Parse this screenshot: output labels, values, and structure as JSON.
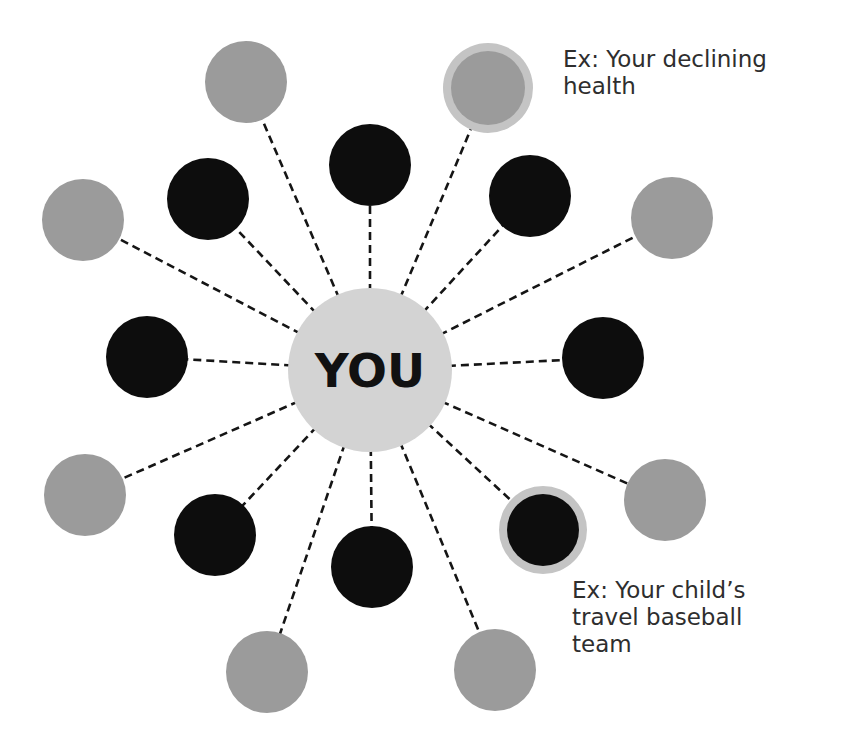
{
  "diagram": {
    "center": {
      "label": "YOU",
      "x": 370,
      "y": 370,
      "r": 82,
      "color": "#d3d3d3"
    },
    "colors": {
      "black_node": "#0d0d0d",
      "gray_node": "#9b9b9b",
      "highlight_ring": "#c4c4c4",
      "highlight_gray_inner": "#9b9b9b",
      "connector": "#151515",
      "text": "#2e2e2e"
    },
    "nodes": [
      {
        "id": "gray-top-left",
        "type": "gray",
        "x": 246,
        "y": 82,
        "r": 41
      },
      {
        "id": "gray-top-right-highlighted",
        "type": "gray",
        "highlight": true,
        "x": 488,
        "y": 88,
        "r": 37,
        "ring_r": 45
      },
      {
        "id": "black-top",
        "type": "black",
        "x": 370,
        "y": 165,
        "r": 41
      },
      {
        "id": "black-upper-left",
        "type": "black",
        "x": 208,
        "y": 199,
        "r": 41
      },
      {
        "id": "black-upper-right",
        "type": "black",
        "x": 530,
        "y": 196,
        "r": 41
      },
      {
        "id": "gray-left-upper",
        "type": "gray",
        "x": 83,
        "y": 220,
        "r": 41
      },
      {
        "id": "gray-right-upper",
        "type": "gray",
        "x": 672,
        "y": 218,
        "r": 41
      },
      {
        "id": "black-left",
        "type": "black",
        "x": 147,
        "y": 357,
        "r": 41
      },
      {
        "id": "black-right",
        "type": "black",
        "x": 603,
        "y": 358,
        "r": 41
      },
      {
        "id": "gray-left-lower",
        "type": "gray",
        "x": 85,
        "y": 495,
        "r": 41
      },
      {
        "id": "gray-right-lower",
        "type": "gray",
        "x": 665,
        "y": 500,
        "r": 41
      },
      {
        "id": "black-lower-left",
        "type": "black",
        "x": 215,
        "y": 535,
        "r": 41
      },
      {
        "id": "black-lower-right-highlighted",
        "type": "black",
        "highlight": true,
        "x": 543,
        "y": 530,
        "r": 36,
        "ring_r": 44
      },
      {
        "id": "black-bottom",
        "type": "black",
        "x": 372,
        "y": 567,
        "r": 41
      },
      {
        "id": "gray-bottom-left",
        "type": "gray",
        "x": 267,
        "y": 672,
        "r": 41
      },
      {
        "id": "gray-bottom-right",
        "type": "gray",
        "x": 495,
        "y": 670,
        "r": 41
      }
    ],
    "annotations": [
      {
        "id": "annotation-declining-health",
        "text": "Ex: Your declining\nhealth",
        "points_to": "gray-top-right-highlighted"
      },
      {
        "id": "annotation-travel-baseball",
        "text": "Ex: Your child’s\ntravel baseball\nteam",
        "points_to": "black-lower-right-highlighted"
      }
    ]
  }
}
